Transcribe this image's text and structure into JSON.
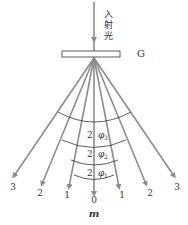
{
  "figure": {
    "incident_label": [
      "入",
      "射",
      "光"
    ],
    "grating_label": "G",
    "order_axis_label": "m",
    "orders_left": [
      "3",
      "2",
      "1"
    ],
    "center_order": "0",
    "orders_right": [
      "1",
      "2",
      "3"
    ],
    "angle_labels": [
      {
        "coef": "2",
        "sym": "φ",
        "sub": "3"
      },
      {
        "coef": "2",
        "sym": "φ",
        "sub": "2"
      },
      {
        "coef": "2",
        "sym": "φ",
        "sub": "1"
      }
    ],
    "colors": {
      "ray": "#8c8c8c",
      "arc": "#333333",
      "grating": "#333333",
      "text": "#333333"
    }
  }
}
